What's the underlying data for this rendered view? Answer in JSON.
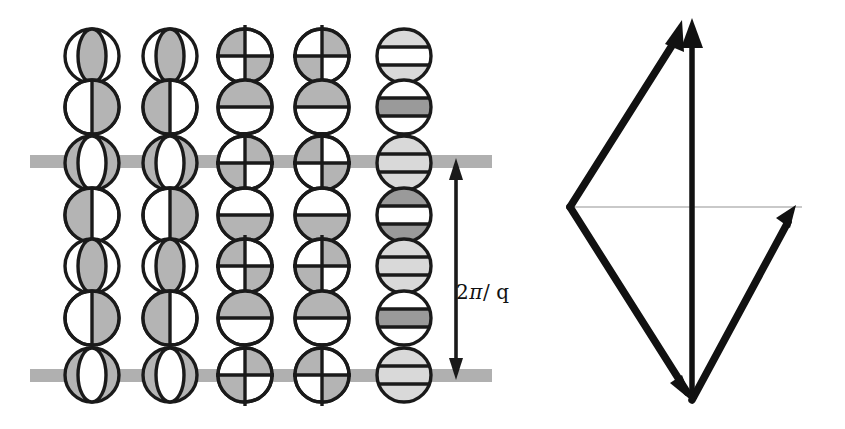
{
  "figure": {
    "background_color": "#ffffff",
    "width": 845,
    "height": 429
  },
  "left_panel": {
    "name": "helical-spin-lattice",
    "description": "Grid of 5 columns by 7 rows of circles showing progressive rotation of shaded regions, intersected by two horizontal gray bands marking one helical period.",
    "colors": {
      "outline": "#1a1a1a",
      "shade_mid": "#b4b4b4",
      "shade_light": "#d9d9d9",
      "shade_dark": "#9a9a9a",
      "band_gray": "#b0b0b0",
      "white": "#ffffff"
    },
    "geometry": {
      "columns": 5,
      "rows": 7,
      "col_x": [
        92,
        170,
        245,
        322,
        404
      ],
      "row_y": [
        56,
        107,
        163,
        215,
        266,
        318,
        375
      ],
      "radius": 27,
      "band_y": [
        161,
        375
      ],
      "band_x_start": 30,
      "band_x_end": 492,
      "band_thickness": 13
    },
    "columns_data": [
      {
        "index": 1,
        "name": "column-ellipse-phase-a",
        "cells": [
          "ellipse-shaded",
          "half-right",
          "ellipse-white",
          "half-left",
          "ellipse-shaded",
          "half-right",
          "ellipse-white"
        ]
      },
      {
        "index": 2,
        "name": "column-ellipse-phase-b",
        "cells": [
          "ellipse-shaded",
          "half-left",
          "ellipse-white",
          "half-right",
          "ellipse-shaded",
          "half-left",
          "ellipse-white"
        ]
      },
      {
        "index": 3,
        "name": "column-quadrant-phase-a",
        "cells": [
          "quad-tl-br",
          "half-top",
          "quad-tr-bl",
          "half-bottom",
          "quad-tl-br",
          "half-top",
          "quad-tr-bl"
        ]
      },
      {
        "index": 4,
        "name": "column-quadrant-phase-b",
        "cells": [
          "quad-tr-bl",
          "half-top",
          "quad-tl-br",
          "half-bottom",
          "quad-tr-bl",
          "half-top",
          "quad-tl-br"
        ]
      },
      {
        "index": 5,
        "name": "column-horizontal-bands",
        "cells": [
          "band-light-white-light",
          "band-white-dark-white",
          "band-light-light-light",
          "band-dark-white-dark",
          "band-light-light-light",
          "band-white-dark-white",
          "band-light-light-light"
        ]
      }
    ],
    "period_marker": {
      "name": "period-double-arrow",
      "label_plain": "2π/ q",
      "label_num": "2",
      "label_pi": "π",
      "label_slash": "/",
      "label_q": "q",
      "x": 456,
      "y_top": 161,
      "y_bottom": 375
    }
  },
  "right_panel": {
    "name": "scattering-vector-triangle",
    "description": "Vector triangle with incident wavevector Q1 and scattered wavevector Q2 summing to scattering vector q(hkl), with scattering angle theta.",
    "colors": {
      "vector": "#111111",
      "guide_line": "#c9c9c9"
    },
    "labels": {
      "q_vector": "q",
      "q_args": "(hkl)",
      "q1_vector": "Q",
      "q1_sub": "1",
      "q2_vector": "Q",
      "q2_sub": "2",
      "theta": "θ"
    },
    "geometry": {
      "origin_bottom": [
        692,
        400
      ],
      "apex_top": [
        692,
        18
      ],
      "left_vertex": [
        570,
        207
      ],
      "right_end": [
        790,
        207
      ],
      "guide_y": 207,
      "guide_x_start": 570,
      "guide_x_end": 800
    }
  }
}
